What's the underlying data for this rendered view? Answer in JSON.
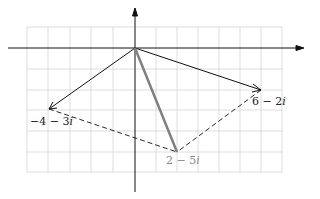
{
  "diagram": {
    "type": "complex-plane-parallelogram",
    "points": [
      {
        "name": "origin",
        "re": 0,
        "im": 0
      },
      {
        "name": "a",
        "label": "6 − 2i",
        "re": 6,
        "im": -2
      },
      {
        "name": "b",
        "label": "−4 − 3i",
        "re": -4,
        "im": -3
      },
      {
        "name": "sum",
        "label": "2 − 5i",
        "re": 2,
        "im": -5
      }
    ],
    "labels": {
      "a_real": "6 − 2",
      "a_imag": "i",
      "b_real": "−4 − 3",
      "b_imag": "i",
      "sum_real": "2 − 5",
      "sum_imag": "i"
    },
    "colors": {
      "vector": "#111111",
      "sum_vector": "#808080",
      "grid": "#cccccc",
      "sum_label": "#888888"
    }
  }
}
